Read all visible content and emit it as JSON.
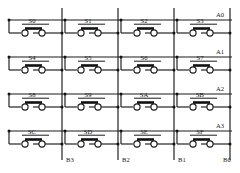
{
  "diagram": {
    "type": "switch-matrix-schematic",
    "rows": 4,
    "columns": 4,
    "line_color": "#1a1a1a",
    "background_color": "#ffffff",
    "contact_color": "#111111"
  },
  "row_bus": {
    "position": "right",
    "labels": [
      "A0",
      "A1",
      "A2",
      "A3"
    ]
  },
  "column_bus": {
    "position": "bottom",
    "labels": [
      "B3",
      "B2",
      "B1",
      "B0"
    ]
  },
  "switches": [
    {
      "label": "S0",
      "row": "A0",
      "column": "B3"
    },
    {
      "label": "S1",
      "row": "A0",
      "column": "B2"
    },
    {
      "label": "S2",
      "row": "A0",
      "column": "B1"
    },
    {
      "label": "S3",
      "row": "A0",
      "column": "B0"
    },
    {
      "label": "S4",
      "row": "A1",
      "column": "B3"
    },
    {
      "label": "S5",
      "row": "A1",
      "column": "B2"
    },
    {
      "label": "S6",
      "row": "A1",
      "column": "B1"
    },
    {
      "label": "S7",
      "row": "A1",
      "column": "B0"
    },
    {
      "label": "S8",
      "row": "A2",
      "column": "B3"
    },
    {
      "label": "S9",
      "row": "A2",
      "column": "B2"
    },
    {
      "label": "SA",
      "row": "A2",
      "column": "B1"
    },
    {
      "label": "SB",
      "row": "A2",
      "column": "B0"
    },
    {
      "label": "SC",
      "row": "A3",
      "column": "B3"
    },
    {
      "label": "SD",
      "row": "A3",
      "column": "B2"
    },
    {
      "label": "SE",
      "row": "A3",
      "column": "B1"
    },
    {
      "label": "SF",
      "row": "A3",
      "column": "B0"
    }
  ],
  "switch_grid": [
    [
      "S0",
      "S1",
      "S2",
      "S3"
    ],
    [
      "S4",
      "S5",
      "S6",
      "S7"
    ],
    [
      "S8",
      "S9",
      "SA",
      "SB"
    ],
    [
      "SC",
      "SD",
      "SE",
      "SF"
    ]
  ],
  "geometry": {
    "row_line_y": [
      20,
      57,
      94,
      131
    ],
    "switch_terminal_y": [
      33,
      70,
      107,
      144
    ],
    "column_line_x": [
      62,
      118,
      174,
      230
    ],
    "row_line_x_start": [
      8,
      64,
      120,
      176
    ],
    "cell_left_x": [
      8,
      64,
      120,
      176
    ],
    "label_offset_y": -6
  }
}
